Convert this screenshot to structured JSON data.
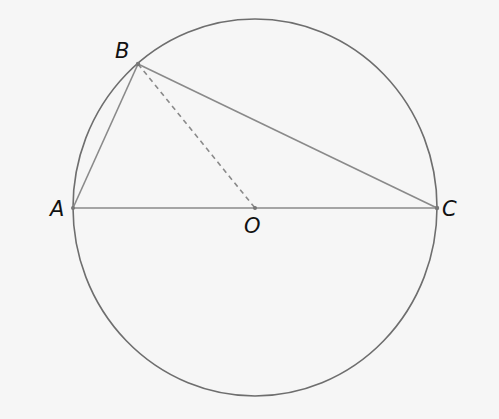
{
  "diagram": {
    "points": {
      "A": {
        "label": "A"
      },
      "B": {
        "label": "B"
      },
      "C": {
        "label": "C"
      },
      "O": {
        "label": "O"
      }
    },
    "segments": [
      {
        "from": "A",
        "to": "B",
        "style": "solid"
      },
      {
        "from": "B",
        "to": "C",
        "style": "solid"
      },
      {
        "from": "A",
        "to": "C",
        "style": "solid"
      },
      {
        "from": "B",
        "to": "O",
        "style": "dashed"
      }
    ],
    "colors": {
      "stroke": "#7a7a7a",
      "circle": "#6e6e6e",
      "label": "#111111"
    }
  }
}
